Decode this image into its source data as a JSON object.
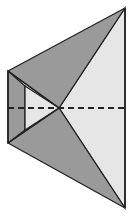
{
  "diagram": {
    "colors": {
      "background": "#ffffff",
      "dark_face": "#9a9a9a",
      "light_face": "#e6e6e6",
      "stroke": "#222222"
    },
    "points": {
      "top_left": [
        8,
        71
      ],
      "bottom_left": [
        8,
        143
      ],
      "inner_top": [
        25,
        86
      ],
      "inner_bottom": [
        25,
        130
      ],
      "center": [
        59,
        108
      ],
      "top_right": [
        125,
        8
      ],
      "bottom_right": [
        125,
        208
      ]
    },
    "axis": {
      "y": 108,
      "x_start": 8,
      "x_end": 126,
      "style": "dashed"
    }
  }
}
